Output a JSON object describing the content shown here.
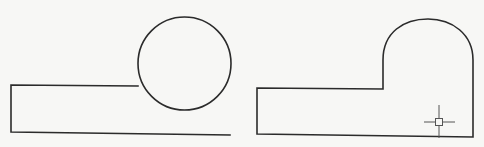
{
  "diagram": {
    "colors": {
      "background": "#f7f7f5",
      "line": "#2b2b2b",
      "cursor": "#555555"
    },
    "left_figure": {
      "polyline": [
        [
          138,
          86
        ],
        [
          11,
          85
        ],
        [
          11,
          132
        ],
        [
          230,
          135
        ]
      ],
      "circle": {
        "cx": 184.5,
        "cy": 63.5,
        "r": 46.5
      }
    },
    "right_figure": {
      "outline": {
        "bottom_left": [
          257,
          134
        ],
        "top_left": [
          257,
          88
        ],
        "step_corner": [
          383,
          89
        ],
        "arc_start": [
          383,
          58
        ],
        "arc_top_y": 19,
        "arc_end": [
          473,
          58
        ],
        "bottom_right": [
          473,
          137
        ]
      },
      "cursor": {
        "icon": "crosshair-pickbox-icon",
        "cx": 439,
        "cy": 122,
        "box_size": 7,
        "arm_h": [
          424,
          455
        ],
        "arm_v": [
          105,
          138
        ]
      }
    }
  }
}
